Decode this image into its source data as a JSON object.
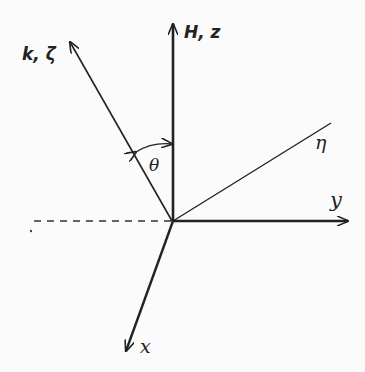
{
  "diagram": {
    "type": "coordinate-axes",
    "axes": {
      "z": {
        "label": "H, z"
      },
      "k": {
        "label": "k, ζ"
      },
      "eta": {
        "label": "η"
      },
      "y": {
        "label": "y"
      },
      "x": {
        "label": "x"
      }
    },
    "angle": {
      "label": "θ"
    },
    "colors": {
      "line": "#222222",
      "background": "#fbfbfb"
    }
  }
}
